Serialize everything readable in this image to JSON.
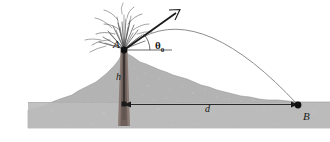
{
  "figure": {
    "type": "physics-diagram",
    "width": 330,
    "height": 142,
    "background_color": "#ffffff"
  },
  "labels": {
    "point_a": "A",
    "point_b": "B",
    "height": "h",
    "distance": "d",
    "angle_symbol": "θ",
    "angle_subscript": "0"
  },
  "colors": {
    "terrain_fill": "#b3b3b3",
    "terrain_edge": "#8f8f8f",
    "ground_band": "#bdbdbd",
    "conduit_dark": "#7a6a66",
    "conduit_core": "#8c7a74",
    "line_black": "#1a1a1a",
    "trajectory": "#8a8a8a",
    "spray": "#555555",
    "text": "#1a1a1a"
  },
  "geometry": {
    "point_a": [
      124,
      50
    ],
    "point_b": [
      298,
      105
    ],
    "base_point": [
      124,
      105
    ],
    "height_px": 55,
    "distance_px": 174,
    "launch_angle_deg": 40,
    "trajectory_peak": [
      205,
      22
    ],
    "ground_line_y": 105,
    "terrain_bottom_y": 128
  },
  "elements": {
    "velocity_vector": "launch-velocity-arrow",
    "angle_arc": "launch-angle-arc",
    "horizontal_reference": "horizontal-reference-line",
    "eruption": "volcanic-ejecta-spray",
    "trajectory": "parabolic-trajectory-path",
    "conduit": "volcanic-conduit-column",
    "height_segment": "height-segment-h",
    "distance_segment": "distance-segment-d"
  }
}
